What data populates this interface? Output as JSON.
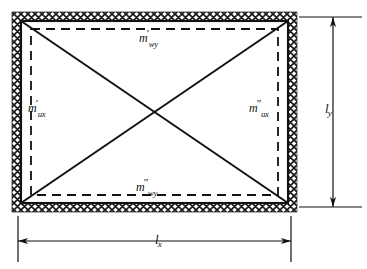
{
  "figure": {
    "type": "engineering-diagram",
    "background_color": "#ffffff",
    "line_color": "#111111",
    "hatch_color": "#1a1a1a"
  },
  "slab": {
    "frame": {
      "name": "hatched-fixed-support-border",
      "style": "crosshatch",
      "outer": {
        "x": 12,
        "y": 12,
        "width": 285,
        "height": 200
      },
      "band_thickness": 9
    },
    "inner_rect": {
      "x": 21,
      "y": 21,
      "width": 267,
      "height": 182
    },
    "dashed_rect": {
      "x": 31,
      "y": 29,
      "width": 247,
      "height": 166
    },
    "diagonals": [
      {
        "name": "diagonal-top-left-to-bottom-right",
        "x1": 21,
        "y1": 21,
        "x2": 288,
        "y2": 203
      },
      {
        "name": "diagonal-bottom-left-to-top-right",
        "x1": 21,
        "y1": 203,
        "x2": 288,
        "y2": 21
      }
    ]
  },
  "labels": {
    "top": {
      "symbol": "m",
      "prime": "′",
      "subscript": "wy",
      "text": "m′wy"
    },
    "left": {
      "symbol": "m",
      "prime": "′",
      "subscript": "ux",
      "text": "m′ux"
    },
    "right": {
      "symbol": "m",
      "prime": "″",
      "subscript": "ux",
      "text": "m″ux"
    },
    "bottom": {
      "symbol": "m",
      "prime": "″",
      "subscript": "wy",
      "text": "m″wy"
    }
  },
  "dimensions": {
    "vertical": {
      "symbol": "l",
      "subscript": "y",
      "text": "ly",
      "name": "dimension-ly"
    },
    "horizontal": {
      "symbol": "l",
      "subscript": "x",
      "text": "lx",
      "name": "dimension-lx"
    }
  }
}
